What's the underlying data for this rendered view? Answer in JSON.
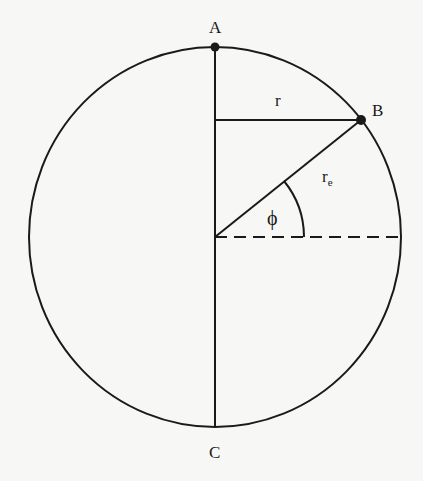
{
  "diagram": {
    "type": "geometry",
    "labels": {
      "A": "A",
      "B": "B",
      "C": "C",
      "r": "r",
      "re_main": "r",
      "re_sub": "e",
      "phi": "ϕ"
    },
    "colors": {
      "background": "#f7f7f5",
      "ink": "#1a1a1a"
    },
    "geometry": {
      "center": [
        215,
        237
      ],
      "radius_x": 186,
      "radius_y": 190,
      "point_A": [
        215,
        47
      ],
      "point_B": [
        361,
        120
      ],
      "point_C": [
        215,
        427
      ],
      "angle_phi_deg": 39
    }
  }
}
